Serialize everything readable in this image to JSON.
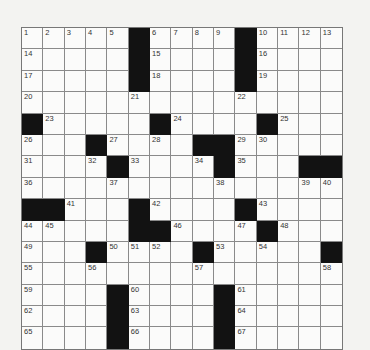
{
  "puzzle": {
    "rows": 15,
    "cols": 15,
    "layout": [
      "#####B####B####",
      "#####B####B####",
      "#####B####B####",
      "###############",
      "B#####B####B###",
      "###B####BB#####",
      "####B####B###BB",
      "###############",
      "BB###B####B####",
      "#####BB####B###",
      "###B####B#####B",
      "###############",
      "####B####B#####",
      "####B####B#####",
      "####B####B#####"
    ],
    "numbers": [
      [
        0,
        0,
        "1"
      ],
      [
        0,
        1,
        "2"
      ],
      [
        0,
        2,
        "3"
      ],
      [
        0,
        3,
        "4"
      ],
      [
        0,
        4,
        "5"
      ],
      [
        0,
        6,
        "6"
      ],
      [
        0,
        7,
        "7"
      ],
      [
        0,
        8,
        "8"
      ],
      [
        0,
        9,
        "9"
      ],
      [
        0,
        11,
        "10"
      ],
      [
        0,
        12,
        "11"
      ],
      [
        0,
        13,
        "12"
      ],
      [
        0,
        14,
        "13"
      ],
      [
        1,
        0,
        "14"
      ],
      [
        1,
        6,
        "15"
      ],
      [
        1,
        11,
        "16"
      ],
      [
        2,
        0,
        "17"
      ],
      [
        2,
        6,
        "18"
      ],
      [
        2,
        11,
        "19"
      ],
      [
        3,
        0,
        "20"
      ],
      [
        3,
        5,
        "21"
      ],
      [
        3,
        10,
        "22"
      ],
      [
        4,
        1,
        "23"
      ],
      [
        4,
        7,
        "24"
      ],
      [
        4,
        12,
        "25"
      ],
      [
        5,
        0,
        "26"
      ],
      [
        5,
        4,
        "27"
      ],
      [
        5,
        6,
        "28"
      ],
      [
        5,
        10,
        "29"
      ],
      [
        5,
        11,
        "30"
      ],
      [
        6,
        0,
        "31"
      ],
      [
        6,
        3,
        "32"
      ],
      [
        6,
        5,
        "33"
      ],
      [
        6,
        8,
        "34"
      ],
      [
        6,
        10,
        "35"
      ],
      [
        7,
        0,
        "36"
      ],
      [
        7,
        4,
        "37"
      ],
      [
        7,
        9,
        "38"
      ],
      [
        7,
        13,
        "39"
      ],
      [
        7,
        14,
        "40"
      ],
      [
        8,
        2,
        "41"
      ],
      [
        8,
        6,
        "42"
      ],
      [
        8,
        11,
        "43"
      ],
      [
        9,
        0,
        "44"
      ],
      [
        9,
        1,
        "45"
      ],
      [
        9,
        7,
        "46"
      ],
      [
        9,
        10,
        "47"
      ],
      [
        9,
        12,
        "48"
      ],
      [
        10,
        0,
        "49"
      ],
      [
        10,
        4,
        "50"
      ],
      [
        10,
        5,
        "51"
      ],
      [
        10,
        6,
        "52"
      ],
      [
        10,
        9,
        "53"
      ],
      [
        10,
        11,
        "54"
      ],
      [
        11,
        0,
        "55"
      ],
      [
        11,
        3,
        "56"
      ],
      [
        11,
        8,
        "57"
      ],
      [
        11,
        14,
        "58"
      ],
      [
        12,
        0,
        "59"
      ],
      [
        12,
        5,
        "60"
      ],
      [
        12,
        10,
        "61"
      ],
      [
        13,
        0,
        "62"
      ],
      [
        13,
        5,
        "63"
      ],
      [
        13,
        10,
        "64"
      ],
      [
        14,
        0,
        "65"
      ],
      [
        14,
        5,
        "66"
      ],
      [
        14,
        10,
        "67"
      ]
    ]
  }
}
